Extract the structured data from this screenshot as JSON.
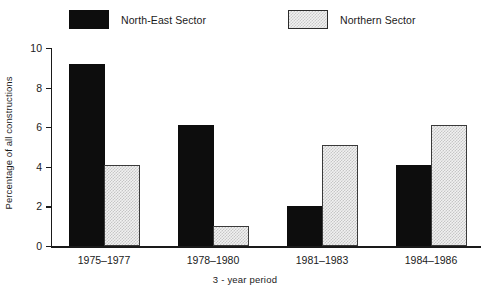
{
  "chart_data": {
    "type": "bar",
    "title": "",
    "categories": [
      "1975–1977",
      "1978–1980",
      "1981–1983",
      "1984–1986"
    ],
    "series": [
      {
        "name": "North-East Sector",
        "values": [
          9,
          6,
          2,
          4
        ],
        "swatch": "solid-black",
        "color": "#0d0d0d"
      },
      {
        "name": "Northern Sector",
        "values": [
          4,
          1,
          5,
          6
        ],
        "swatch": "light-hatch",
        "color": "#f1f1f1"
      }
    ],
    "xlabel": "3 - year period",
    "ylabel": "Percentage of all constructions",
    "ylim": [
      0,
      10
    ],
    "ytick_values": [
      0,
      2,
      4,
      6,
      8,
      10
    ],
    "ytick_labels": [
      "0",
      "2",
      "4",
      "6",
      "8",
      "10"
    ],
    "grid": false,
    "legend_position": "top"
  },
  "legend": {
    "items": [
      {
        "label": "North-East Sector"
      },
      {
        "label": "Northern Sector"
      }
    ]
  },
  "axes": {
    "y_title": "Percentage of all constructions",
    "x_title": "3 - year period",
    "y_ticks": [
      "0",
      "2",
      "4",
      "6",
      "8",
      "10"
    ],
    "x_categories": [
      "1975–1977",
      "1978–1980",
      "1981–1983",
      "1984–1986"
    ]
  }
}
